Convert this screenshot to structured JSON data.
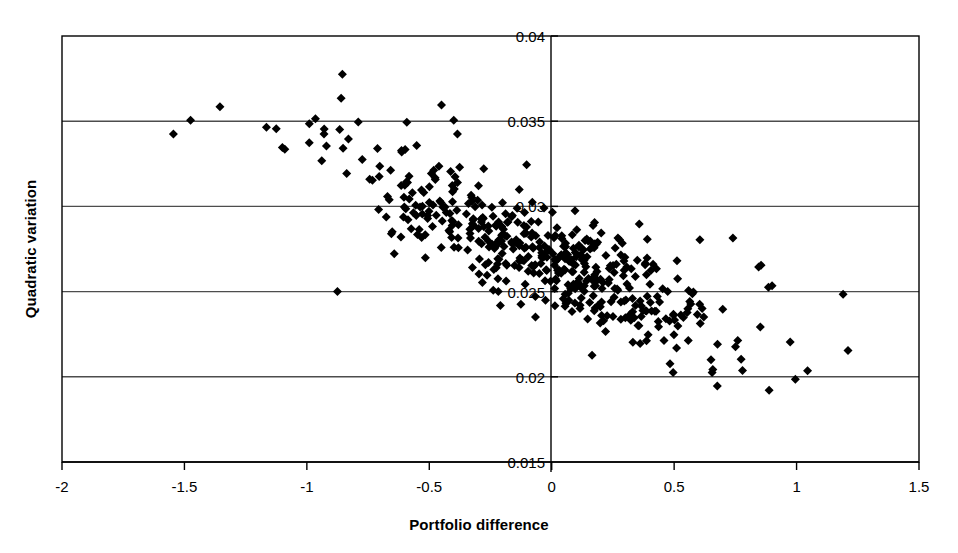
{
  "chart_data": {
    "type": "scatter",
    "title": "",
    "xlabel": "Portfolio difference",
    "ylabel": "Quadratic variation",
    "xlim": [
      -2,
      1.5
    ],
    "ylim": [
      0.015,
      0.04
    ],
    "xticks": [
      -2,
      -1.5,
      -1,
      -0.5,
      0,
      0.5,
      1,
      1.5
    ],
    "xticklabels": [
      "-2",
      "-1.5",
      "-1",
      "-0.5",
      "0",
      "0.5",
      "1",
      "1.5"
    ],
    "yticks": [
      0.015,
      0.02,
      0.025,
      0.03,
      0.035,
      0.04
    ],
    "yticklabels": [
      "0.015",
      "0.02",
      "0.025",
      "0.03",
      "0.035",
      "0.04"
    ],
    "grid": "horizontal",
    "legend": "none",
    "marker": "diamond",
    "marker_color": "#000000",
    "marker_size_px": 9,
    "n_points": 498,
    "correlation": -0.85,
    "x_mean": -0.05,
    "x_sd": 0.38,
    "y_mean": 0.0272,
    "y_sd": 0.0028,
    "series_name": "portfolio difference vs quadratic variation",
    "outliers": [
      {
        "x": -1.545,
        "y": 0.03425
      },
      {
        "x": -1.475,
        "y": 0.03505
      },
      {
        "x": -1.355,
        "y": 0.03585
      },
      {
        "x": -1.165,
        "y": 0.03465
      },
      {
        "x": -1.125,
        "y": 0.03455
      },
      {
        "x": -1.1,
        "y": 0.03345
      },
      {
        "x": -1.09,
        "y": 0.03335
      },
      {
        "x": -0.99,
        "y": 0.03485
      },
      {
        "x": -0.965,
        "y": 0.03515
      },
      {
        "x": -0.93,
        "y": 0.03425
      },
      {
        "x": -0.92,
        "y": 0.03355
      },
      {
        "x": -0.875,
        "y": 0.025
      },
      {
        "x": -0.855,
        "y": 0.03775
      },
      {
        "x": -0.86,
        "y": 0.03635
      },
      {
        "x": -0.79,
        "y": 0.03495
      },
      {
        "x": -0.45,
        "y": 0.03595
      },
      {
        "x": -0.4,
        "y": 0.03505
      },
      {
        "x": -0.385,
        "y": 0.03425
      },
      {
        "x": 0.095,
        "y": 0.02975
      },
      {
        "x": 0.175,
        "y": 0.02905
      },
      {
        "x": 0.605,
        "y": 0.02805
      },
      {
        "x": 0.74,
        "y": 0.02815
      },
      {
        "x": 0.655,
        "y": 0.02025
      },
      {
        "x": 0.995,
        "y": 0.01985
      },
      {
        "x": 1.045,
        "y": 0.02035
      },
      {
        "x": 1.19,
        "y": 0.02485
      },
      {
        "x": 1.21,
        "y": 0.02155
      },
      {
        "x": 0.885,
        "y": 0.02525
      },
      {
        "x": 0.9,
        "y": 0.02535
      },
      {
        "x": 0.845,
        "y": 0.02645
      },
      {
        "x": 0.855,
        "y": 0.02655
      }
    ]
  },
  "geometry": {
    "plot_left": 62,
    "plot_right": 919,
    "plot_top": 36,
    "plot_bottom": 462,
    "zero_x_px": 551
  },
  "axis": {
    "line_color": "#000000",
    "grid_color": "#4d4d4d"
  }
}
